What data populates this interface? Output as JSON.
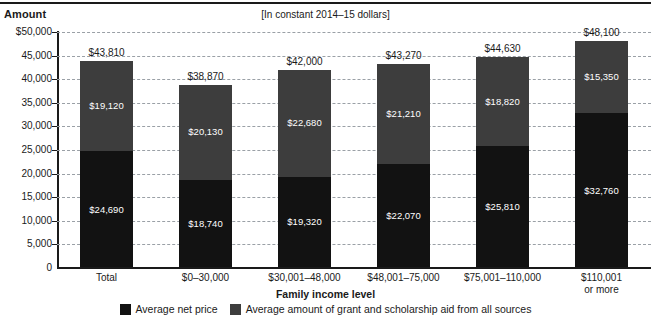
{
  "header": {
    "y_axis_title": "Amount",
    "units_note": "[In constant 2014–15 dollars]"
  },
  "axis": {
    "x_title": "Family income level",
    "y_ticks": [
      "$50,000",
      "45,000",
      "40,000",
      "35,000",
      "30,000",
      "25,000",
      "20,000",
      "15,000",
      "10,000",
      "5,000",
      "0"
    ]
  },
  "legend": {
    "items": [
      {
        "label": "Average net price",
        "color": "#121212"
      },
      {
        "label": "Average amount of grant and scholarship aid from all sources",
        "color": "#3d3d3d"
      }
    ]
  },
  "chart_data": {
    "type": "bar",
    "subtype": "stacked",
    "title": "",
    "subtitle": "[In constant 2014–15 dollars]",
    "xlabel": "Family income level",
    "ylabel": "Amount",
    "ylim": [
      0,
      50000
    ],
    "ytick_step": 5000,
    "grid": true,
    "legend_position": "bottom",
    "categories": [
      "Total",
      "$0–30,000",
      "$30,001–48,000",
      "$48,001–75,000",
      "$75,001–110,000",
      "$110,001 or more"
    ],
    "category_lines": [
      [
        "Total"
      ],
      [
        "$0–30,000"
      ],
      [
        "$30,001–48,000"
      ],
      [
        "$48,001–75,000"
      ],
      [
        "$75,001–110,000"
      ],
      [
        "$110,001",
        "or more"
      ]
    ],
    "series": [
      {
        "name": "Average net price",
        "color": "#121212",
        "values": [
          24690,
          18740,
          19320,
          22070,
          25810,
          32760
        ],
        "labels": [
          "$24,690",
          "$18,740",
          "$19,320",
          "$22,070",
          "$25,810",
          "$32,760"
        ]
      },
      {
        "name": "Average amount of grant and scholarship aid from all sources",
        "color": "#3d3d3d",
        "values": [
          19120,
          20130,
          22680,
          21210,
          18820,
          15350
        ],
        "labels": [
          "$19,120",
          "$20,130",
          "$22,680",
          "$21,210",
          "$18,820",
          "$15,350"
        ]
      }
    ],
    "totals": [
      43810,
      38870,
      42000,
      43270,
      44630,
      48100
    ],
    "total_labels": [
      "$43,810",
      "$38,870",
      "$42,000",
      "$43,270",
      "$44,630",
      "$48,100"
    ]
  }
}
